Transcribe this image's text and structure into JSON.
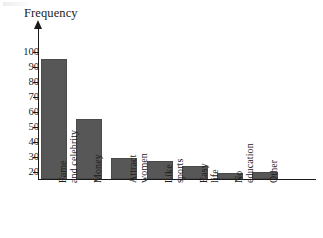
{
  "chart_data": {
    "type": "bar",
    "title": "",
    "subtitle": "",
    "xlabel": "",
    "ylabel": "Frequency",
    "categories": [
      "Fame and celebrity",
      "Money",
      "Attract women",
      "Like sports",
      "Easy life",
      "No education",
      "Other"
    ],
    "values": [
      95,
      55,
      29,
      27,
      24,
      19,
      20
    ],
    "ylim": [
      15,
      104
    ],
    "yticks": [
      20,
      30,
      40,
      50,
      60,
      70,
      80,
      90,
      100
    ],
    "ytick_labels": [
      "20",
      "30",
      "40",
      "50",
      "60",
      "70",
      "80",
      "90",
      "100"
    ],
    "grid": false,
    "legend": false,
    "bar_color": "#575757",
    "axis_color": "#1a1a1a",
    "y_axis_arrow": true
  },
  "axis": {
    "y_title": "Frequency"
  },
  "icons": {
    "y_axis_arrow": "arrow-up-icon"
  }
}
